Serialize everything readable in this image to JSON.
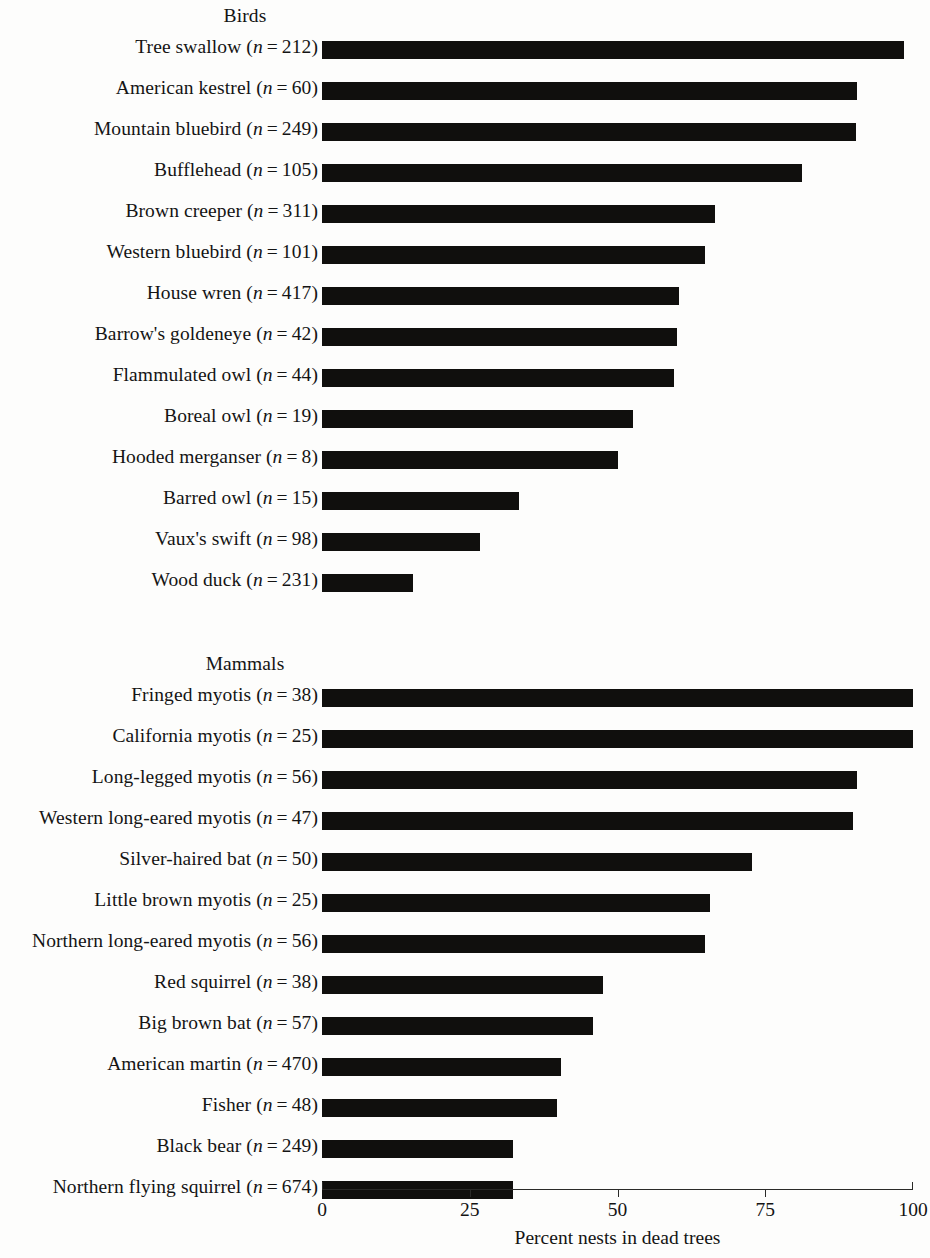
{
  "chart_data": {
    "type": "bar",
    "orientation": "horizontal",
    "title": "",
    "xlabel": "Percent nests in dead trees",
    "ylabel": "",
    "xlim": [
      0,
      100
    ],
    "xticks": [
      0,
      25,
      50,
      75,
      100
    ],
    "xticklabels": [
      "0",
      "25",
      "50",
      "75",
      "100"
    ],
    "grid": false,
    "legend": null,
    "bar_color": "#100f0d",
    "panels": [
      {
        "title": "Birds",
        "categories": [
          "Tree swallow (n = 212)",
          "American kestrel (n = 60)",
          "Mountain bluebird (n = 249)",
          "Bufflehead (n = 105)",
          "Brown creeper (n = 311)",
          "Western bluebird (n = 101)",
          "House wren (n = 417)",
          "Barrow's goldeneye (n = 42)",
          "Flammulated owl (n = 44)",
          "Boreal owl (n = 19)",
          "Hooded merganser (n = 8)",
          "Barred owl (n = 15)",
          "Vaux's swift (n = 98)",
          "Wood duck (n = 231)"
        ],
        "values": [
          98.5,
          90.5,
          90.3,
          81.2,
          66.5,
          64.8,
          60.4,
          60.0,
          59.5,
          52.6,
          50.0,
          33.4,
          26.8,
          15.4
        ],
        "items": [
          {
            "species": "Tree swallow",
            "n": 212,
            "value": 98.5
          },
          {
            "species": "American kestrel",
            "n": 60,
            "value": 90.5
          },
          {
            "species": "Mountain bluebird",
            "n": 249,
            "value": 90.3
          },
          {
            "species": "Bufflehead",
            "n": 105,
            "value": 81.2
          },
          {
            "species": "Brown creeper",
            "n": 311,
            "value": 66.5
          },
          {
            "species": "Western bluebird",
            "n": 101,
            "value": 64.8
          },
          {
            "species": "House wren",
            "n": 417,
            "value": 60.4
          },
          {
            "species": "Barrow's goldeneye",
            "n": 42,
            "value": 60.0
          },
          {
            "species": "Flammulated owl",
            "n": 44,
            "value": 59.5
          },
          {
            "species": "Boreal owl",
            "n": 19,
            "value": 52.6
          },
          {
            "species": "Hooded merganser",
            "n": 8,
            "value": 50.0
          },
          {
            "species": "Barred owl",
            "n": 15,
            "value": 33.4
          },
          {
            "species": "Vaux's swift",
            "n": 98,
            "value": 26.8
          },
          {
            "species": "Wood duck",
            "n": 231,
            "value": 15.4
          }
        ]
      },
      {
        "title": "Mammals",
        "categories": [
          "Fringed myotis (n = 38)",
          "California myotis (n = 25)",
          "Long-legged myotis (n = 56)",
          "Western long-eared myotis (n = 47)",
          "Silver-haired bat (n = 50)",
          "Little brown myotis (n = 25)",
          "Northern long-eared myotis (n = 56)",
          "Red squirrel (n = 38)",
          "Big brown bat (n = 57)",
          "American martin (n = 470)",
          "Fisher (n = 48)",
          "Black bear (n = 249)",
          "Northern flying squirrel (n = 674)"
        ],
        "values": [
          100.0,
          100.0,
          90.5,
          89.8,
          72.7,
          65.6,
          64.8,
          47.5,
          45.8,
          40.4,
          39.8,
          32.3,
          32.3
        ],
        "items": [
          {
            "species": "Fringed myotis",
            "n": 38,
            "value": 100.0
          },
          {
            "species": "California myotis",
            "n": 25,
            "value": 100.0
          },
          {
            "species": "Long-legged myotis",
            "n": 56,
            "value": 90.5
          },
          {
            "species": "Western long-eared myotis",
            "n": 47,
            "value": 89.8
          },
          {
            "species": "Silver-haired bat",
            "n": 50,
            "value": 72.7
          },
          {
            "species": "Little brown myotis",
            "n": 25,
            "value": 65.6
          },
          {
            "species": "Northern long-eared myotis",
            "n": 56,
            "value": 64.8
          },
          {
            "species": "Red squirrel",
            "n": 38,
            "value": 47.5
          },
          {
            "species": "Big brown bat",
            "n": 57,
            "value": 45.8
          },
          {
            "species": "American martin",
            "n": 470,
            "value": 40.4
          },
          {
            "species": "Fisher",
            "n": 48,
            "value": 39.8
          },
          {
            "species": "Black bear",
            "n": 249,
            "value": 32.3
          },
          {
            "species": "Northern flying squirrel",
            "n": 674,
            "value": 32.3
          }
        ]
      }
    ]
  }
}
